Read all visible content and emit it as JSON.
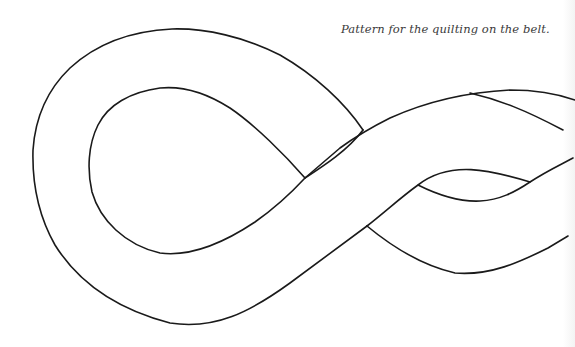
{
  "caption": "Pattern for the quilting on the belt.",
  "figure": {
    "stroke_color": "#1a1a1a",
    "background_color": "#ffffff"
  }
}
